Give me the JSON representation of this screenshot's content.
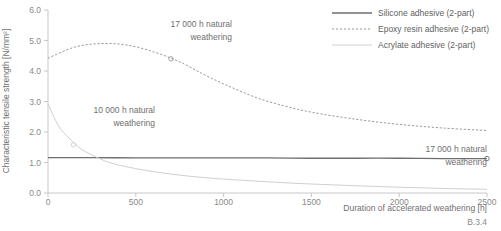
{
  "figure_number": "B.3.4",
  "legend": {
    "position": "top-right",
    "items": [
      {
        "label": "Silicone adhesive (2-part)",
        "style": "solid",
        "color": "#6e6e6e",
        "name": "silicone"
      },
      {
        "label": "Epoxy resin adhesive (2-part)",
        "style": "dashed",
        "color": "#9a9a9a",
        "name": "epoxy"
      },
      {
        "label": "Acrylate adhesive (2-part)",
        "style": "solid-light",
        "color": "#cfcfcf",
        "name": "acrylate"
      }
    ]
  },
  "annotations": [
    {
      "text_line1": "17 000 h natural",
      "text_line2": "weathering",
      "name": "epoxy-17000h"
    },
    {
      "text_line1": "10 000 h natural",
      "text_line2": "weathering",
      "name": "acrylate-10000h"
    },
    {
      "text_line1": "17 000 h natural",
      "text_line2": "weathering",
      "name": "silicone-17000h"
    }
  ],
  "chart_data": {
    "type": "line",
    "title": "",
    "xlabel": "Duration of accelerated weathering [h]",
    "ylabel": "Characteristic tensile strength [N/mm²]",
    "xlim": [
      0,
      2500
    ],
    "ylim": [
      0.0,
      6.0
    ],
    "xticks": [
      0,
      500,
      1000,
      1500,
      2000,
      2500
    ],
    "xtick_labels": [
      "0",
      "500",
      "1000",
      "1500",
      "2000",
      "2500"
    ],
    "yticks": [
      0.0,
      1.0,
      2.0,
      3.0,
      4.0,
      5.0,
      6.0
    ],
    "ytick_labels": [
      "0.0",
      "1.0",
      "2.0",
      "3.0",
      "4.0",
      "5.0",
      "6.0"
    ],
    "grid": false,
    "legend_position": "upper right",
    "series": [
      {
        "name": "Silicone adhesive (2-part)",
        "style": "solid",
        "color": "#6e6e6e",
        "x": [
          0,
          250,
          500,
          750,
          1000,
          1250,
          1500,
          1750,
          2000,
          2250,
          2500
        ],
        "values": [
          1.16,
          1.16,
          1.15,
          1.15,
          1.15,
          1.15,
          1.14,
          1.14,
          1.14,
          1.13,
          1.13
        ],
        "marker_point": {
          "x": 2500,
          "y": 1.13,
          "label": "17 000 h natural weathering"
        }
      },
      {
        "name": "Epoxy resin adhesive (2-part)",
        "style": "dashed",
        "color": "#9a9a9a",
        "x": [
          0,
          150,
          300,
          450,
          600,
          750,
          900,
          1050,
          1200,
          1350,
          1500,
          1750,
          2000,
          2250,
          2500
        ],
        "values": [
          4.42,
          4.78,
          4.9,
          4.85,
          4.63,
          4.3,
          3.85,
          3.45,
          3.1,
          2.85,
          2.65,
          2.42,
          2.25,
          2.13,
          2.05
        ],
        "marker_point": {
          "x": 700,
          "y": 4.4,
          "label": "17 000 h natural weathering"
        }
      },
      {
        "name": "Acrylate adhesive (2-part)",
        "style": "solid-light",
        "color": "#cfcfcf",
        "x": [
          0,
          60,
          120,
          180,
          250,
          350,
          500,
          700,
          900,
          1100,
          1400,
          1700,
          2000,
          2250,
          2500
        ],
        "values": [
          2.92,
          2.2,
          1.8,
          1.48,
          1.25,
          1.0,
          0.8,
          0.62,
          0.5,
          0.42,
          0.32,
          0.25,
          0.19,
          0.15,
          0.12
        ],
        "marker_point": {
          "x": 145,
          "y": 1.58,
          "label": "10 000 h natural weathering"
        }
      }
    ]
  }
}
